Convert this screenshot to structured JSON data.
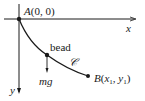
{
  "diagram": {
    "type": "brachistochrone",
    "labels": {
      "origin": "A(0, 0)",
      "x_axis": "x",
      "y_axis": "y",
      "bead": "bead",
      "force": "mg",
      "curve": "𝒞",
      "endpoint_prefix": "B(",
      "endpoint_x": "x",
      "endpoint_x_sub": "1",
      "endpoint_sep": ", ",
      "endpoint_y": "y",
      "endpoint_y_sub": "1",
      "endpoint_suffix": ")"
    },
    "colors": {
      "stroke": "#1a1a1a",
      "background": "#ffffff"
    }
  }
}
